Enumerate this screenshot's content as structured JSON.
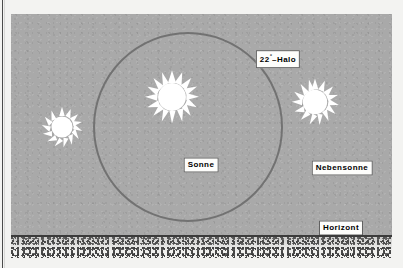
{
  "figure": {
    "background_color": "#f3f3f1",
    "sky_color": "#a9a9a9",
    "ground_color": "#f2f2f0",
    "halo_stroke_color": "#6e6e6e",
    "sun_color": "#ffffff",
    "label_text_color": "#000000",
    "label_box_color": "#fdfdfb"
  },
  "halo": {
    "label_prefix": "22",
    "label_degree": "°",
    "label_suffix": "–Halo",
    "center_x": 201,
    "center_y": 126,
    "radius": 95
  },
  "suns": [
    {
      "name": "left-parhelion",
      "label": "",
      "x": 62,
      "y": 127,
      "size": 46,
      "rays": 14
    },
    {
      "name": "sun",
      "label": "Sonne",
      "x": 201,
      "y": 126,
      "size": 58,
      "rays": 16
    },
    {
      "name": "right-parhelion",
      "label": "Nebensonne",
      "x": 341,
      "y": 127,
      "size": 52,
      "rays": 15
    }
  ],
  "labels": {
    "sun": "Sonne",
    "parhelion": "Nebensonne",
    "horizon": "Horizont"
  }
}
